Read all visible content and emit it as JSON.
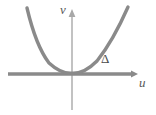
{
  "figure": {
    "title": "",
    "background_color": "#ffffff",
    "axes": {
      "vertical": {
        "label": "v",
        "label_style": "italic",
        "color": "#a8a8a8",
        "stroke_width": 1.4,
        "x": 72,
        "y_top": 14,
        "y_bottom": 110,
        "arrow": "up"
      },
      "horizontal": {
        "label": "u",
        "label_style": "italic",
        "color": "#8a8a8a",
        "stroke_width": 3.4,
        "y": 74,
        "x_left": 8,
        "x_right": 137,
        "arrow": "right"
      }
    },
    "annotations": [
      {
        "name": "delta-symbol",
        "text": "Δ",
        "color": "#4a4a4a",
        "x": 101,
        "y": 52
      }
    ],
    "curve": {
      "name": "parabola",
      "color": "#8a8a8a",
      "stroke_width": 3.4,
      "vertex": [
        72,
        73
      ],
      "left_endpoint": [
        27,
        8
      ],
      "right_endpoint": [
        128,
        7
      ],
      "path": "M 27 8 Q 36 46 49 63 Q 61 74 72 73.2 Q 84 74 97 61 Q 113 41 128 7"
    }
  },
  "chart_data": {
    "type": "line",
    "title": "",
    "xlabel": "u",
    "ylabel": "v",
    "grid": false,
    "legend": null,
    "annotations": [
      "Δ"
    ],
    "series": [
      {
        "name": "parabola",
        "description": "upward-opening parabola tangent to the u-axis at the origin",
        "x": [
          -45,
          -36,
          -23,
          -11,
          0,
          12,
          25,
          41,
          56
        ],
        "y": [
          65,
          44,
          20,
          7,
          0,
          7,
          20,
          44,
          66
        ]
      }
    ],
    "xlim": [
      -64,
      65
    ],
    "ylim": [
      -36,
      69
    ]
  }
}
